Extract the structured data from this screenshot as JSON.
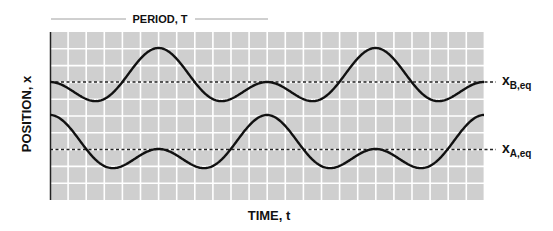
{
  "figure": {
    "period_label": "PERIOD, T",
    "y_axis_label": "POSITION, x",
    "x_axis_label": "TIME, t",
    "eq_labels": {
      "B": {
        "main": "x",
        "sub": "B,eq"
      },
      "A": {
        "main": "x",
        "sub": "A,eq"
      }
    }
  },
  "chart_data": {
    "type": "line",
    "title": "",
    "xlabel": "TIME, t",
    "ylabel": "POSITION, x",
    "grid": true,
    "annotations": [
      "PERIOD, T (arrow spanning one period)",
      "x_B,eq",
      "x_A,eq"
    ],
    "colors": {
      "background": "#cfcfcf",
      "grid": "#ffffff",
      "curve": "#111111",
      "text": "#111111"
    },
    "plot_px": {
      "left": 50,
      "top": 32,
      "right": 484,
      "bottom": 200,
      "cell_w": 18.1,
      "cell_h": 16.8
    },
    "period_px": 217,
    "periods_shown": 2,
    "series": [
      {
        "name": "B",
        "equilibrium_y_px": 82,
        "a": 17,
        "b": 17,
        "form": "displacement = -(a*cos(theta) - b*cos(2*theta)) + (a - b)... rendered as y = eq - (a*cos(th) - b*cos(2th) - (a-b))",
        "sign": -1
      },
      {
        "name": "A",
        "equilibrium_y_px": 149,
        "a": 17,
        "b": 17,
        "form": "y = eq - (a*cos(th) + b*cos(2th))",
        "sign": 1
      }
    ]
  }
}
